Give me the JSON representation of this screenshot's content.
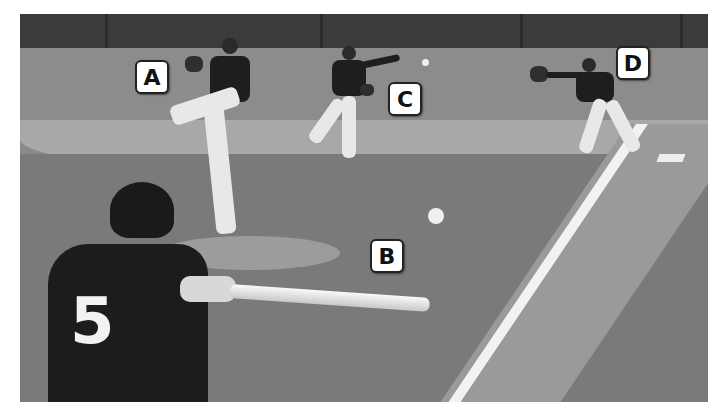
{
  "image": {
    "description": "Grayscale photo of a baseball play: batter in foreground swinging, pitcher on the mound, infielder throwing, first baseman catching",
    "tone": "grayscale"
  },
  "labels": [
    {
      "id": "A",
      "text": "A",
      "refers_to": "pitcher"
    },
    {
      "id": "B",
      "text": "B",
      "refers_to": "pitched ball in flight"
    },
    {
      "id": "C",
      "text": "C",
      "refers_to": "infielder throwing"
    },
    {
      "id": "D",
      "text": "D",
      "refers_to": "first baseman catching"
    }
  ],
  "batter": {
    "jersey_number": "5"
  },
  "colors": {
    "wall": "#3b3b3b",
    "grass": "#7a7a7a",
    "dirt": "#a8a8a8",
    "line": "#f2f2f2",
    "label_bg": "#ffffff",
    "label_border": "#222222"
  }
}
